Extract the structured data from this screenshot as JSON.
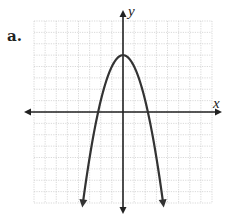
{
  "chart_data": {
    "type": "line",
    "title": "",
    "panel_label": "a.",
    "xlabel": "x",
    "ylabel": "y",
    "xlim": [
      -8,
      8
    ],
    "ylim": [
      -8,
      8
    ],
    "grid": true,
    "grid_step": 1,
    "function": "y = 5 - x^2",
    "series": [
      {
        "name": "parabola",
        "vertex": [
          0,
          5
        ],
        "x_intercepts": [
          -2.24,
          2.24
        ],
        "x": [
          -3.6,
          -3,
          -2.24,
          -2,
          -1,
          0,
          1,
          2,
          2.24,
          3,
          3.6
        ],
        "y": [
          -7.96,
          -4,
          0,
          1,
          4,
          5,
          4,
          1,
          0,
          -4,
          -7.96
        ],
        "arrows": "both-ends-down"
      }
    ]
  },
  "colors": {
    "axis": "#222222",
    "curve": "#333333",
    "grid": "#c8c8c8"
  }
}
